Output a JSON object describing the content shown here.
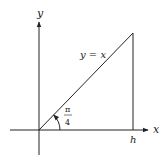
{
  "diagram": {
    "type": "coordinate-plot",
    "axes": {
      "x_label": "x",
      "y_label": "y"
    },
    "line_label": "y = x",
    "angle_label": {
      "numerator": "π",
      "denominator": "4"
    },
    "point_label": "h",
    "colors": {
      "stroke": "#222222",
      "background": "#ffffff"
    }
  }
}
